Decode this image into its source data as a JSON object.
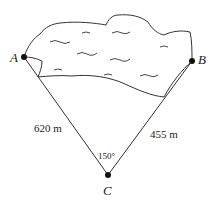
{
  "diagram": {
    "points": {
      "A": {
        "label": "A",
        "x": 24,
        "y": 57
      },
      "B": {
        "label": "B",
        "x": 192,
        "y": 61
      },
      "C": {
        "label": "C",
        "x": 108,
        "y": 175
      }
    },
    "segments": {
      "AC": {
        "length_label": "620 m"
      },
      "BC": {
        "length_label": "455 m"
      }
    },
    "angle_C": {
      "label": "150°"
    },
    "region": {
      "name": "lake"
    }
  }
}
